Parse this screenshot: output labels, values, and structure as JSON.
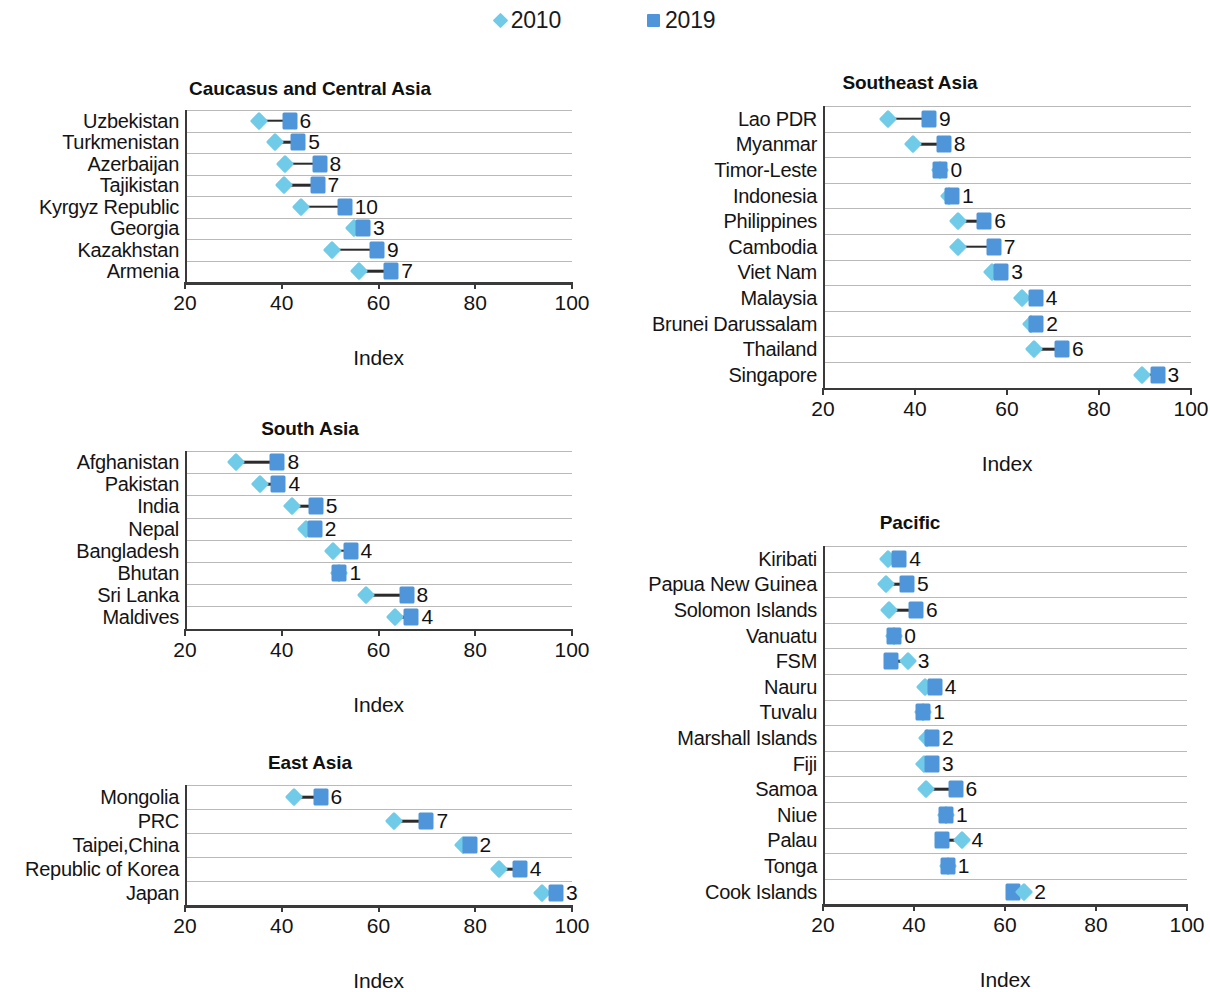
{
  "legend": {
    "items": [
      {
        "label": "2010",
        "marker": "diamond-marker",
        "color": "#6fcbe8"
      },
      {
        "label": "2019",
        "marker": "square-marker",
        "color": "#4e96d9"
      }
    ]
  },
  "axis": {
    "title": "Index",
    "ticks": [
      "20",
      "40",
      "60",
      "80",
      "100"
    ],
    "min": 20,
    "max": 100
  },
  "chart_data": [
    {
      "type": "scatter",
      "title": "Caucasus and Central Asia",
      "xlabel": "Index",
      "ylabel": "",
      "xlim": [
        20,
        100
      ],
      "grid": true,
      "legend_position": "top-center",
      "categories": [
        "Uzbekistan",
        "Turkmenistan",
        "Azerbaijan",
        "Tajikistan",
        "Kyrgyz Republic",
        "Georgia",
        "Kazakhstan",
        "Armenia"
      ],
      "series": [
        {
          "name": "2010",
          "values": [
            34.9,
            38.1,
            40.3,
            40.1,
            43.5,
            54.6,
            50.0,
            55.6
          ]
        },
        {
          "name": "2019",
          "values": [
            41.2,
            43.0,
            47.4,
            47.0,
            52.6,
            56.4,
            59.3,
            62.2
          ]
        }
      ],
      "point_labels": [
        "6",
        "5",
        "8",
        "7",
        "10",
        "3",
        "9",
        "7"
      ]
    },
    {
      "type": "scatter",
      "title": "Southeast Asia",
      "xlabel": "Index",
      "ylabel": "",
      "xlim": [
        20,
        100
      ],
      "grid": true,
      "legend_position": "top-center",
      "categories": [
        "Lao PDR",
        "Myanmar",
        "Timor-Leste",
        "Indonesia",
        "Philippines",
        "Cambodia",
        "Viet Nam",
        "Malaysia",
        "Brunei Darussalam",
        "Thailand",
        "Singapore"
      ],
      "series": [
        {
          "name": "2010",
          "values": [
            33.8,
            39.1,
            45.0,
            46.9,
            49.0,
            48.9,
            56.2,
            62.9,
            64.7,
            65.4,
            89.0
          ]
        },
        {
          "name": "2019",
          "values": [
            42.6,
            45.8,
            45.1,
            47.6,
            54.6,
            56.7,
            58.3,
            65.8,
            65.9,
            71.5,
            92.3
          ]
        }
      ],
      "point_labels": [
        "9",
        "8",
        "0",
        "1",
        "6",
        "7",
        "3",
        "4",
        "2",
        "6",
        "3"
      ]
    },
    {
      "type": "scatter",
      "title": "South Asia",
      "xlabel": "Index",
      "ylabel": "",
      "xlim": [
        20,
        100
      ],
      "grid": true,
      "legend_position": "top-center",
      "categories": [
        "Afghanistan",
        "Pakistan",
        "India",
        "Nepal",
        "Bangladesh",
        "Bhutan",
        "Sri Lanka",
        "Maldives"
      ],
      "series": [
        {
          "name": "2010",
          "values": [
            30.2,
            35.0,
            41.8,
            44.6,
            50.1,
            51.5,
            57.0,
            62.9
          ]
        },
        {
          "name": "2019",
          "values": [
            38.7,
            38.9,
            46.6,
            46.4,
            53.8,
            51.5,
            65.4,
            66.4
          ]
        }
      ],
      "point_labels": [
        "8",
        "4",
        "5",
        "2",
        "4",
        "1",
        "8",
        "4"
      ]
    },
    {
      "type": "scatter",
      "title": "East Asia",
      "xlabel": "Index",
      "ylabel": "",
      "xlim": [
        20,
        100
      ],
      "grid": true,
      "legend_position": "top-center",
      "categories": [
        "Mongolia",
        "PRC",
        "Taipei,China",
        "Republic of Korea",
        "Japan"
      ],
      "series": [
        {
          "name": "2010",
          "values": [
            42.2,
            62.8,
            77.0,
            84.4,
            93.4
          ]
        },
        {
          "name": "2019",
          "values": [
            47.6,
            69.5,
            78.4,
            88.8,
            96.3
          ]
        }
      ],
      "point_labels": [
        "6",
        "7",
        "2",
        "4",
        "3"
      ]
    },
    {
      "type": "scatter",
      "title": "Pacific",
      "xlabel": "Index",
      "ylabel": "",
      "xlim": [
        20,
        100
      ],
      "grid": true,
      "legend_position": "top-center",
      "categories": [
        "Kiribati",
        "Papua New Guinea",
        "Solomon Islands",
        "Vanuatu",
        "FSM",
        "Nauru",
        "Tuvalu",
        "Marshall Islands",
        "Fiji",
        "Samoa",
        "Niue",
        "Palau",
        "Tonga",
        "Cook Islands"
      ],
      "series": [
        {
          "name": "2010",
          "values": [
            33.9,
            33.4,
            34.0,
            35.2,
            38.2,
            41.9,
            41.6,
            42.5,
            41.7,
            42.3,
            46.6,
            50.0,
            47.0,
            63.8
          ]
        },
        {
          "name": "2019",
          "values": [
            36.3,
            38.0,
            40.0,
            35.2,
            34.6,
            44.1,
            41.6,
            43.5,
            43.5,
            48.7,
            46.6,
            45.8,
            47.0,
            61.4
          ]
        }
      ],
      "point_labels": [
        "4",
        "5",
        "6",
        "0",
        "3",
        "4",
        "1",
        "2",
        "3",
        "6",
        "1",
        "4",
        "1",
        "2"
      ]
    }
  ]
}
